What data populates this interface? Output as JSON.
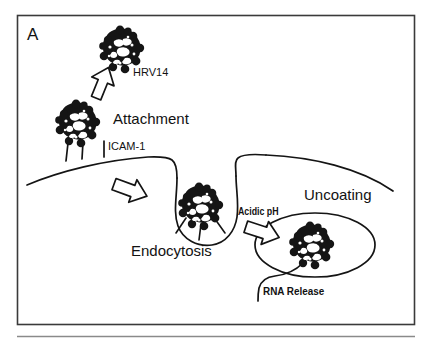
{
  "figure": {
    "panel_label": "A",
    "background_color": "#ffffff",
    "ink_color": "#121212",
    "border_color": "#3a3a3a",
    "caption_rule": true
  },
  "labels": {
    "virus_name": "HRV14",
    "attachment": "Attachment",
    "receptor": "ICAM-1",
    "endocytosis": "Endocytosis",
    "acidic_ph": "Acidic pH",
    "uncoating": "Uncoating",
    "rna_release": "RNA Release"
  },
  "diagram_data": {
    "type": "pathway-diagram",
    "subject": "HRV14 cell entry and uncoating pathway",
    "steps": [
      {
        "order": 1,
        "name": "HRV14",
        "description": "Free virion approaches the cell surface"
      },
      {
        "order": 2,
        "name": "Attachment",
        "description": "Virion binds ICAM-1 receptors on the plasma membrane"
      },
      {
        "order": 3,
        "name": "Endocytosis",
        "description": "Membrane invaginates, internalizing the receptor-bound virion"
      },
      {
        "order": 4,
        "name": "Acidic pH",
        "description": "Endosome acidification triggers conformational change"
      },
      {
        "order": 5,
        "name": "Uncoating",
        "description": "Capsid destabilizes within the endosome"
      },
      {
        "order": 6,
        "name": "RNA Release",
        "description": "Viral genomic RNA exits the capsid into the cytoplasm"
      }
    ],
    "virions": [
      {
        "id": "free-virion",
        "cx": 122,
        "cy": 50,
        "r": 21,
        "stage": "HRV14"
      },
      {
        "id": "attached-virion",
        "cx": 78,
        "cy": 124,
        "r": 21,
        "stage": "Attachment"
      },
      {
        "id": "endocytosed-virion",
        "cx": 201,
        "cy": 207,
        "r": 21,
        "stage": "Endocytosis"
      },
      {
        "id": "uncoating-virion",
        "cx": 312,
        "cy": 246,
        "r": 21,
        "stage": "Uncoating"
      }
    ],
    "receptors": {
      "name": "ICAM-1",
      "count": 3
    },
    "arrows": [
      {
        "id": "arrow-attachment",
        "direction": "down-left"
      },
      {
        "id": "arrow-endocytosis",
        "direction": "right"
      },
      {
        "id": "arrow-uncoating",
        "direction": "right"
      }
    ]
  }
}
